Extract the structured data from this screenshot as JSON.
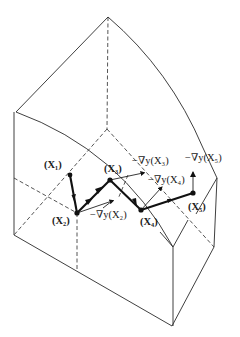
{
  "diagram": {
    "type": "steepest-ascent-path-on-3d-surface",
    "points": [
      {
        "id": "x1",
        "label": "(X₁)",
        "x": 70,
        "y": 175
      },
      {
        "id": "x2",
        "label": "(X₂)",
        "x": 77,
        "y": 213
      },
      {
        "id": "x3",
        "label": "(X₃)",
        "x": 110,
        "y": 180
      },
      {
        "id": "x4",
        "label": "(X₄)",
        "x": 141,
        "y": 210
      },
      {
        "id": "x5",
        "label": "(X₅)",
        "x": 193,
        "y": 193
      }
    ],
    "gradient_labels": {
      "g2": "−∇y(X₂)",
      "g3": "−∇y(X₃)",
      "g4": "−∇y(X₄)",
      "g5": "−∇y(X₅)"
    },
    "colors": {
      "line": "#2a2a2a",
      "path": "#111111",
      "background": "#ffffff"
    }
  }
}
